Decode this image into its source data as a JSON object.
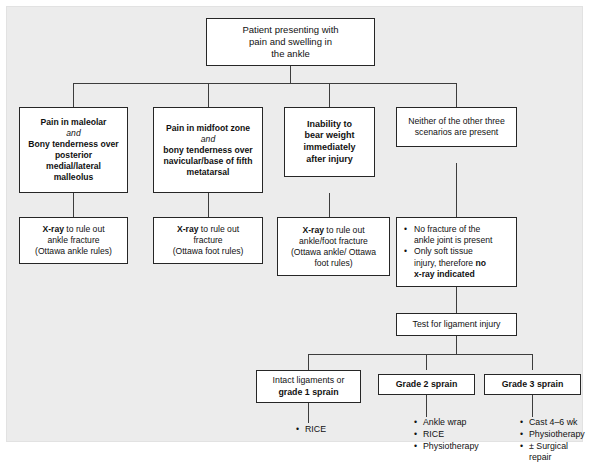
{
  "diagram": {
    "background_color": "#ececec",
    "box_border_color": "#262626",
    "box_fill_color": "#ffffff",
    "connector_color": "#3d3d3d"
  },
  "root": {
    "line1": "Patient presenting with",
    "line2": "pain and swelling in",
    "line3": "the ankle"
  },
  "criteria": [
    {
      "id": "malleolar",
      "line1": "Pain in maleolar",
      "line2": "and",
      "line3": "Bony tenderness over",
      "line4": "posterior",
      "line5": "medial/lateral",
      "line6": "malleolus"
    },
    {
      "id": "midfoot",
      "line1": "Pain in midfoot zone",
      "line2": "and",
      "line3": "bony tenderness over",
      "line4": "navicular/base of fifth",
      "line5": "metatarsal"
    },
    {
      "id": "weightbearing",
      "line1": "Inability to",
      "line2": "bear weight",
      "line3": "immediately",
      "line4": "after injury"
    },
    {
      "id": "none-of-three",
      "line1": "Neither of the other three",
      "line2": "scenarios are present"
    }
  ],
  "actions": [
    {
      "id": "xray-ankle",
      "lead": "X-ray",
      "line1_rest": " to rule out",
      "line2": "ankle fracture",
      "line3": "(Ottawa ankle rules)"
    },
    {
      "id": "xray-foot",
      "lead": "X-ray",
      "line1_rest": " to rule out",
      "line2": "fracture",
      "line3": "(Ottawa foot rules)"
    },
    {
      "id": "xray-ankle-foot",
      "lead": "X-ray",
      "line1_rest": " to rule out",
      "line2": "ankle/foot fracture",
      "line3": "(Ottawa ankle/ Ottawa",
      "line4": "foot rules)"
    }
  ],
  "no_fracture_box": {
    "bullet1_line1": "No fracture of the",
    "bullet1_line2": "ankle joint is present",
    "bullet2_line1": "Only soft tissue",
    "bullet2_line2_prefix": "injury, therefore ",
    "bullet2_line2_bold": "no",
    "bullet2_line3_bold": "x-ray indicated"
  },
  "ligament_test": {
    "label": "Test for ligament injury"
  },
  "outcomes": [
    {
      "id": "grade-1",
      "line1": "Intact ligaments or",
      "line2_bold": "grade 1 sprain",
      "treatments": [
        "RICE"
      ]
    },
    {
      "id": "grade-2",
      "line1_bold": "Grade 2 sprain",
      "treatments": [
        "Ankle wrap",
        "RICE",
        "Physiotherapy"
      ]
    },
    {
      "id": "grade-3",
      "line1_bold": "Grade 3 sprain",
      "treatments": [
        "Cast 4–6 wk",
        "Physiotherapy",
        "± Surgical repair"
      ]
    }
  ],
  "bullet_glyph": "•"
}
